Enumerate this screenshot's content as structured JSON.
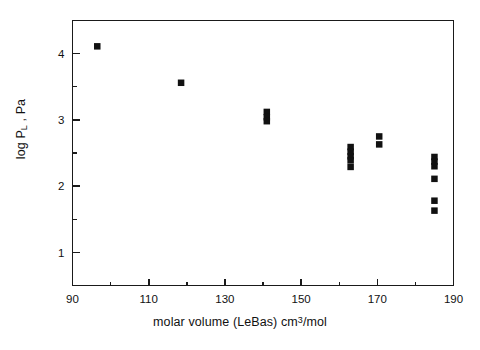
{
  "chart_data": {
    "type": "scatter",
    "title": "",
    "xlabel": "molar volume (LeBas) cm³/mol",
    "xlabel_parts": {
      "prefix": "molar volume (LeBas) cm",
      "superscript": "3",
      "suffix": "/mol"
    },
    "ylabel": "log P_L , Pa",
    "ylabel_parts": {
      "prefix": "log P",
      "subscript": "L",
      "suffix": " , Pa"
    },
    "xlim": [
      90,
      190
    ],
    "ylim": [
      0.5,
      4.5
    ],
    "xticks": [
      90,
      110,
      130,
      150,
      170,
      190
    ],
    "xtick_labels": [
      "90",
      "110",
      "130",
      "150",
      "170",
      "190"
    ],
    "xticks_minor": [
      100,
      120,
      140,
      160,
      180
    ],
    "yticks": [
      1,
      2,
      3,
      4
    ],
    "ytick_labels": [
      "1",
      "2",
      "3",
      "4"
    ],
    "yticks_minor": [
      1.5,
      2.5,
      3.5
    ],
    "grid": false,
    "legend": null,
    "marker": {
      "shape": "square",
      "color": "#111111",
      "size_px": 6.5
    },
    "series": [
      {
        "name": "vapour pressure data",
        "color": "#111111",
        "points": [
          {
            "x": 96.5,
            "y": 4.11
          },
          {
            "x": 118.5,
            "y": 3.56
          },
          {
            "x": 141.0,
            "y": 3.12
          },
          {
            "x": 141.0,
            "y": 3.04
          },
          {
            "x": 141.0,
            "y": 2.98
          },
          {
            "x": 163.0,
            "y": 2.59
          },
          {
            "x": 163.0,
            "y": 2.52
          },
          {
            "x": 163.0,
            "y": 2.45
          },
          {
            "x": 163.0,
            "y": 2.39
          },
          {
            "x": 163.0,
            "y": 2.29
          },
          {
            "x": 170.5,
            "y": 2.75
          },
          {
            "x": 170.5,
            "y": 2.63
          },
          {
            "x": 185.0,
            "y": 2.44
          },
          {
            "x": 185.0,
            "y": 2.37
          },
          {
            "x": 185.0,
            "y": 2.3
          },
          {
            "x": 185.0,
            "y": 2.11
          },
          {
            "x": 185.0,
            "y": 1.78
          },
          {
            "x": 185.0,
            "y": 1.63
          }
        ]
      }
    ]
  },
  "axes": {
    "x_axis_name": "x-axis",
    "y_axis_name": "y-axis",
    "frame_name": "plot-frame"
  }
}
